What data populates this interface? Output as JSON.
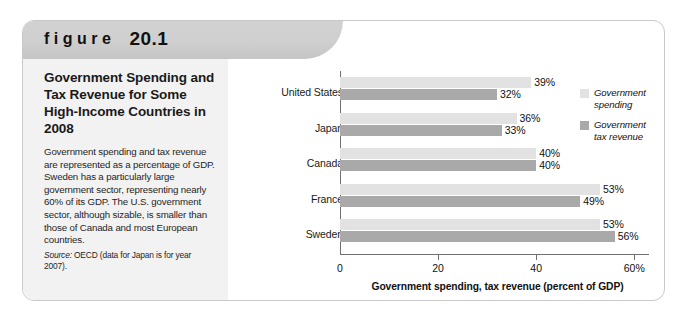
{
  "figure": {
    "header_word": "figure",
    "header_number": "20.1",
    "title": "Government Spending and Tax Revenue for Some High-Income Countries in 2008",
    "description": "Government spending and tax revenue are represented as a percentage of GDP. Sweden has a particularly large government sector, representing nearly 60% of its GDP. The U.S. government sector, although sizable, is smaller than those of Canada and most European countries.",
    "source_label": "Source:",
    "source_text": " OECD (data for Japan is for year 2007)."
  },
  "colors": {
    "spending_bar": "#e2e2e2",
    "tax_revenue_bar": "#a9a9a9",
    "axis": "#6f6f6f",
    "header_band": "#cfcfcf",
    "left_panel": "#f2f2f2"
  },
  "chart_data": {
    "type": "bar",
    "orientation": "horizontal",
    "title": "Government Spending and Tax Revenue for Some High-Income Countries in 2008",
    "categories": [
      "United States",
      "Japan",
      "Canada",
      "France",
      "Sweden"
    ],
    "series": [
      {
        "name": "Government spending",
        "values": [
          39,
          36,
          40,
          53,
          53
        ],
        "labels": [
          "39%",
          "36%",
          "40%",
          "53%",
          "53%"
        ]
      },
      {
        "name": "Government tax revenue",
        "values": [
          32,
          33,
          40,
          49,
          56
        ],
        "labels": [
          "32%",
          "33%",
          "40%",
          "49%",
          "56%"
        ]
      }
    ],
    "xlabel": "Government spending, tax revenue (percent of GDP)",
    "ylabel": "",
    "xlim": [
      0,
      63
    ],
    "xticks": [
      0,
      20,
      40,
      60
    ],
    "xtick_labels": [
      "0",
      "20",
      "40",
      "60%"
    ],
    "grid": false,
    "legend_position": "right"
  },
  "legend": [
    {
      "label_line1": "Government",
      "label_line2": "spending"
    },
    {
      "label_line1": "Government",
      "label_line2": "tax revenue"
    }
  ]
}
